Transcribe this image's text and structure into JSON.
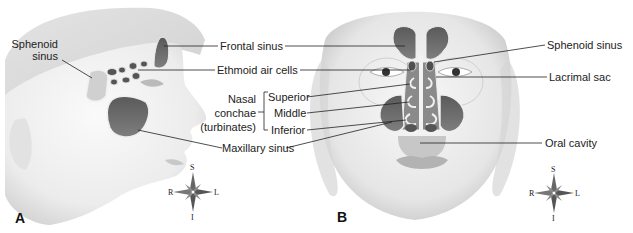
{
  "figure": {
    "panels": [
      {
        "id": "A",
        "letter": "A",
        "view": "lateral"
      },
      {
        "id": "B",
        "letter": "B",
        "view": "anterior"
      }
    ],
    "labels": {
      "sphenoid_sinus_a_line1": "Sphenoid",
      "sphenoid_sinus_a_line2": "sinus",
      "frontal_sinus": "Frontal sinus",
      "ethmoid_air_cells": "Ethmoid air cells",
      "nasal_conchae_line1": "Nasal",
      "nasal_conchae_line2": "conchae",
      "nasal_conchae_line3": "(turbinates)",
      "superior": "Superior",
      "middle": "Middle",
      "inferior": "Inferior",
      "maxillary_sinus": "Maxillary sinus",
      "sphenoid_sinus_b": "Sphenoid sinus",
      "lacrimal_sac": "Lacrimal sac",
      "oral_cavity": "Oral cavity"
    },
    "compass": {
      "superior": "S",
      "inferior": "I",
      "right": "R",
      "left": "L"
    },
    "colors": {
      "sinus_fill": "#6f6f6f",
      "sinus_outline": "#e8e8e8",
      "skin_shade": "#d9d9d9",
      "leader_line": "#222222"
    }
  }
}
